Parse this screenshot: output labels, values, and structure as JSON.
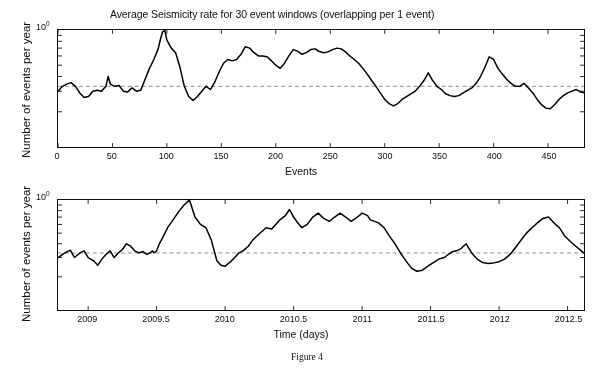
{
  "figure": {
    "caption": "Figure 4"
  },
  "chart_data": [
    {
      "type": "line",
      "panel": "top",
      "title": "Average Seismicity rate for 30 event windows (overlapping per 1 event)",
      "xlabel": "Events",
      "ylabel": "Number of events per year",
      "yscale": "log",
      "ytick_labels": [
        "10",
        "0"
      ],
      "ytick_display": "10^0",
      "xlim": [
        0,
        483
      ],
      "ylim_decades": 1.0,
      "ylim_top_value": 1.0,
      "grid": false,
      "legend": "none",
      "reference_line": {
        "style": "dashed",
        "color": "#8a8a8a",
        "value_fraction_of_decade": 0.33,
        "label": "mean background rate"
      },
      "x": [
        0,
        4,
        8,
        12,
        16,
        20,
        24,
        28,
        32,
        36,
        40,
        44,
        46,
        48,
        52,
        56,
        60,
        64,
        68,
        72,
        76,
        80,
        84,
        88,
        92,
        94,
        96,
        98,
        100,
        104,
        108,
        112,
        116,
        120,
        124,
        128,
        132,
        136,
        140,
        144,
        148,
        152,
        156,
        160,
        164,
        168,
        172,
        176,
        180,
        184,
        188,
        192,
        196,
        200,
        204,
        208,
        212,
        216,
        220,
        224,
        228,
        232,
        236,
        240,
        244,
        248,
        252,
        256,
        260,
        264,
        268,
        272,
        276,
        280,
        284,
        288,
        292,
        296,
        300,
        304,
        308,
        312,
        316,
        320,
        324,
        328,
        332,
        336,
        340,
        344,
        348,
        352,
        356,
        360,
        364,
        368,
        372,
        376,
        380,
        384,
        388,
        392,
        396,
        400,
        404,
        408,
        412,
        416,
        420,
        424,
        428,
        432,
        436,
        440,
        444,
        448,
        452,
        456,
        460,
        464,
        468,
        472,
        476,
        480,
        483
      ],
      "y": [
        0.3,
        0.33,
        0.345,
        0.355,
        0.33,
        0.29,
        0.265,
        0.27,
        0.3,
        0.305,
        0.3,
        0.33,
        0.4,
        0.345,
        0.33,
        0.335,
        0.3,
        0.295,
        0.32,
        0.3,
        0.305,
        0.38,
        0.47,
        0.56,
        0.69,
        0.83,
        0.96,
        1.0,
        0.82,
        0.7,
        0.64,
        0.48,
        0.33,
        0.27,
        0.25,
        0.27,
        0.3,
        0.33,
        0.31,
        0.36,
        0.44,
        0.52,
        0.56,
        0.545,
        0.56,
        0.62,
        0.72,
        0.7,
        0.64,
        0.6,
        0.6,
        0.59,
        0.545,
        0.5,
        0.47,
        0.52,
        0.6,
        0.68,
        0.66,
        0.62,
        0.64,
        0.68,
        0.69,
        0.655,
        0.64,
        0.65,
        0.68,
        0.7,
        0.69,
        0.65,
        0.6,
        0.56,
        0.52,
        0.47,
        0.42,
        0.37,
        0.33,
        0.29,
        0.255,
        0.235,
        0.225,
        0.235,
        0.255,
        0.27,
        0.285,
        0.3,
        0.33,
        0.37,
        0.43,
        0.37,
        0.33,
        0.31,
        0.285,
        0.275,
        0.27,
        0.275,
        0.29,
        0.305,
        0.32,
        0.35,
        0.4,
        0.48,
        0.59,
        0.56,
        0.47,
        0.42,
        0.38,
        0.35,
        0.33,
        0.33,
        0.35,
        0.32,
        0.29,
        0.255,
        0.23,
        0.215,
        0.212,
        0.23,
        0.255,
        0.275,
        0.29,
        0.3,
        0.31,
        0.295,
        0.29
      ]
    },
    {
      "type": "line",
      "panel": "bottom",
      "title": "",
      "xlabel": "Time (days)",
      "ylabel": "Number of events per year",
      "yscale": "log",
      "ytick_labels": [
        "10",
        "0"
      ],
      "ytick_display": "10^0",
      "xlim": [
        2008.78,
        2012.62
      ],
      "ylim_decades": 1.0,
      "ylim_top_value": 1.0,
      "grid": false,
      "legend": "none",
      "reference_line": {
        "style": "dashed",
        "color": "#8a8a8a",
        "value_fraction_of_decade": 0.33,
        "label": "mean background rate"
      },
      "x": [
        2008.78,
        2008.83,
        2008.87,
        2008.9,
        2008.94,
        2008.97,
        2009.0,
        2009.04,
        2009.07,
        2009.1,
        2009.13,
        2009.16,
        2009.19,
        2009.22,
        2009.25,
        2009.28,
        2009.31,
        2009.34,
        2009.37,
        2009.4,
        2009.43,
        2009.45,
        2009.47,
        2009.48,
        2009.5,
        2009.52,
        2009.55,
        2009.58,
        2009.62,
        2009.66,
        2009.7,
        2009.74,
        2009.78,
        2009.82,
        2009.86,
        2009.9,
        2009.94,
        2009.97,
        2010.0,
        2010.04,
        2010.07,
        2010.1,
        2010.13,
        2010.17,
        2010.2,
        2010.24,
        2010.27,
        2010.3,
        2010.34,
        2010.37,
        2010.4,
        2010.44,
        2010.47,
        2010.5,
        2010.53,
        2010.56,
        2010.6,
        2010.64,
        2010.68,
        2010.72,
        2010.76,
        2010.8,
        2010.84,
        2010.88,
        2010.92,
        2010.96,
        2011.0,
        2011.04,
        2011.06,
        2011.09,
        2011.12,
        2011.16,
        2011.2,
        2011.24,
        2011.28,
        2011.32,
        2011.36,
        2011.4,
        2011.44,
        2011.48,
        2011.52,
        2011.56,
        2011.6,
        2011.63,
        2011.66,
        2011.69,
        2011.72,
        2011.76,
        2011.8,
        2011.84,
        2011.88,
        2011.92,
        2011.96,
        2012.0,
        2012.04,
        2012.08,
        2012.12,
        2012.16,
        2012.2,
        2012.24,
        2012.28,
        2012.32,
        2012.36,
        2012.4,
        2012.44,
        2012.48,
        2012.52,
        2012.56,
        2012.6,
        2012.62
      ],
      "y": [
        0.3,
        0.33,
        0.35,
        0.3,
        0.33,
        0.345,
        0.3,
        0.28,
        0.255,
        0.29,
        0.32,
        0.345,
        0.3,
        0.33,
        0.355,
        0.4,
        0.38,
        0.345,
        0.33,
        0.34,
        0.32,
        0.33,
        0.345,
        0.33,
        0.345,
        0.4,
        0.47,
        0.56,
        0.66,
        0.78,
        0.9,
        1.0,
        0.7,
        0.6,
        0.56,
        0.43,
        0.28,
        0.255,
        0.25,
        0.275,
        0.3,
        0.33,
        0.345,
        0.38,
        0.43,
        0.48,
        0.52,
        0.56,
        0.545,
        0.6,
        0.66,
        0.72,
        0.82,
        0.7,
        0.62,
        0.56,
        0.6,
        0.7,
        0.76,
        0.68,
        0.64,
        0.7,
        0.76,
        0.7,
        0.64,
        0.69,
        0.76,
        0.72,
        0.66,
        0.64,
        0.62,
        0.56,
        0.47,
        0.4,
        0.33,
        0.28,
        0.24,
        0.225,
        0.23,
        0.25,
        0.27,
        0.29,
        0.3,
        0.32,
        0.34,
        0.345,
        0.36,
        0.4,
        0.33,
        0.29,
        0.27,
        0.265,
        0.268,
        0.275,
        0.29,
        0.32,
        0.37,
        0.43,
        0.5,
        0.56,
        0.62,
        0.68,
        0.7,
        0.62,
        0.56,
        0.47,
        0.42,
        0.38,
        0.345,
        0.33,
        0.3,
        0.28
      ]
    }
  ]
}
